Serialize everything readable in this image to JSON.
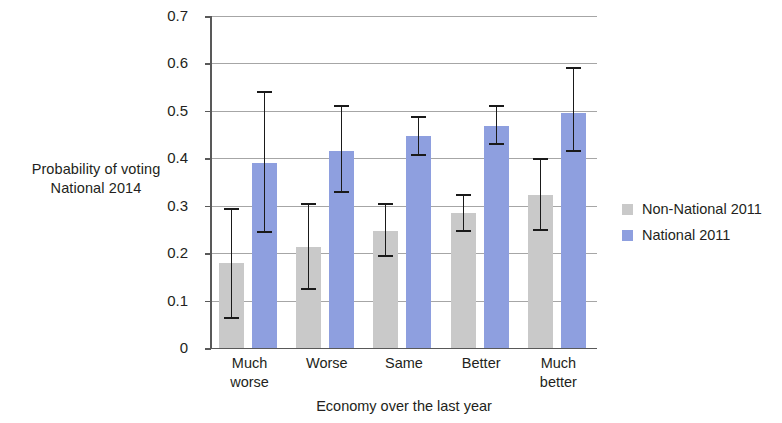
{
  "chart_data": {
    "type": "bar",
    "title": "",
    "xlabel": "Economy over the last year",
    "ylabel": "Probability of voting National 2014",
    "ylabel_lines": [
      "Probability of voting",
      "National 2014"
    ],
    "categories": [
      "Much worse",
      "Worse",
      "Same",
      "Better",
      "Much better"
    ],
    "category_lines": [
      [
        "Much",
        "worse"
      ],
      [
        "Worse",
        ""
      ],
      [
        "Same",
        ""
      ],
      [
        "Better",
        ""
      ],
      [
        "Much",
        "better"
      ]
    ],
    "ylim": [
      0,
      0.7
    ],
    "yticks": [
      0,
      0.1,
      0.2,
      0.3,
      0.4,
      0.5,
      0.6,
      0.7
    ],
    "ytick_labels": [
      "0",
      "0.1",
      "0.2",
      "0.3",
      "0.4",
      "0.5",
      "0.6",
      "0.7"
    ],
    "grid": true,
    "grid_axis": "y",
    "legend_position": "right",
    "series": [
      {
        "name": "Non-National 2011",
        "color": "#c9c9c9",
        "values": [
          0.179,
          0.212,
          0.246,
          0.285,
          0.323
        ],
        "error_low": [
          0.062,
          0.122,
          0.191,
          0.245,
          0.247
        ],
        "error_high": [
          0.295,
          0.305,
          0.305,
          0.325,
          0.4
        ]
      },
      {
        "name": "National 2011",
        "color": "#8e9fdf",
        "values": [
          0.39,
          0.416,
          0.446,
          0.469,
          0.496
        ],
        "error_low": [
          0.243,
          0.326,
          0.404,
          0.428,
          0.413
        ],
        "error_high": [
          0.541,
          0.512,
          0.489,
          0.512,
          0.592
        ]
      }
    ]
  },
  "legend": {
    "items": [
      {
        "label": "Non-National 2011",
        "color": "#c9c9c9"
      },
      {
        "label": "National 2011",
        "color": "#8e9fdf"
      }
    ]
  },
  "axes": {
    "y_title_line1": "Probability of voting",
    "y_title_line2": "National 2014",
    "x_title": "Economy over the last year"
  }
}
